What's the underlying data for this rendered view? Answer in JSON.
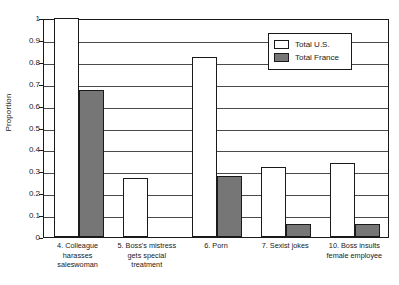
{
  "chart_data": {
    "type": "bar",
    "title": "",
    "xlabel": "",
    "ylabel": "Proportion",
    "ylim": [
      0,
      1
    ],
    "ytick_labels": [
      "1",
      "0.9",
      "0.8",
      "0.7",
      "0.6",
      "0.5",
      "0.4",
      "0.3",
      "0.2",
      "0.1",
      "0"
    ],
    "ytick_values": [
      1,
      0.9,
      0.8,
      0.7,
      0.6,
      0.5,
      0.4,
      0.3,
      0.2,
      0.1,
      0
    ],
    "grid": true,
    "legend_position": "upper right",
    "categories": [
      "4. Colleague harasses saleswoman",
      "5. Boss's mistress gets special treatment",
      "6. Porn",
      "7. Sexist jokes",
      "10. Boss insults female employee"
    ],
    "category_lines": [
      [
        "4. Colleague",
        "harasses",
        "saleswoman"
      ],
      [
        "5. Boss's mistress",
        "gets special",
        "treatment"
      ],
      [
        "6. Porn"
      ],
      [
        "7. Sexist jokes"
      ],
      [
        "10. Boss insults",
        "female employee"
      ]
    ],
    "series": [
      {
        "name": "Total U.S.",
        "color": "#ffffff",
        "edge_color": "#1a1a1a",
        "values": [
          1.0,
          0.27,
          0.82,
          0.32,
          0.34
        ]
      },
      {
        "name": "Total France",
        "color": "#767676",
        "edge_color": "#1a1a1a",
        "values": [
          0.67,
          0.0,
          0.28,
          0.06,
          0.06
        ]
      }
    ]
  },
  "legend": {
    "entries": [
      {
        "label": "Total U.S.",
        "swatch": "us"
      },
      {
        "label": "Total France",
        "swatch": "fr"
      }
    ]
  }
}
